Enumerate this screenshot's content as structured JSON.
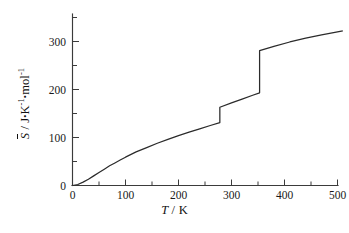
{
  "figure": {
    "background_color": "#ffffff",
    "line_color": "#2b2b2b",
    "axis_color": "#3b3b3b"
  },
  "axes": {
    "x": {
      "label_variable": "T",
      "label_separator": " / ",
      "label_unit": "K",
      "label_full": "T / K",
      "ticks": [
        "0",
        "100",
        "200",
        "300",
        "400",
        "500"
      ],
      "tick_values": [
        0,
        100,
        200,
        300,
        400,
        500
      ],
      "minor_ticks_per_interval": 1,
      "range": [
        0,
        510
      ]
    },
    "y": {
      "label_variable": "S",
      "label_overbar": true,
      "label_separator": " / ",
      "label_unit_1": "J",
      "label_unit_2": "K",
      "label_unit_2_exp": "-1",
      "label_unit_3": "mol",
      "label_unit_3_exp": "-1",
      "label_full": "S̅ / J·K⁻¹·mol⁻¹",
      "ticks": [
        "0",
        "100",
        "200",
        "300"
      ],
      "tick_values": [
        0,
        100,
        200,
        300
      ],
      "minor_ticks_per_interval": 1,
      "range": [
        0,
        355
      ]
    }
  },
  "chart_data": {
    "type": "line",
    "title": "",
    "subtitle": "",
    "xlabel": "T / K",
    "ylabel": "S̅ / J·K⁻¹·mol⁻¹",
    "xlim": [
      0,
      510
    ],
    "ylim": [
      0,
      355
    ],
    "grid": false,
    "legend": null,
    "series": [
      {
        "name": "Molar entropy",
        "color": "#2b2b2b",
        "segments": [
          {
            "phase": "solid",
            "x": [
              0,
              10,
              20,
              30,
              40,
              50,
              60,
              70,
              80,
              90,
              100,
              120,
              140,
              160,
              180,
              200,
              220,
              240,
              260,
              278
            ],
            "y": [
              0,
              2,
              7,
              13,
              20,
              27,
              34,
              41,
              47,
              53,
              59,
              70,
              79,
              88,
              96,
              104,
              111,
              118,
              125,
              131
            ]
          },
          {
            "phase": "liquid",
            "x": [
              278,
              300,
              320,
              340,
              353
            ],
            "y": [
              163,
              172,
              180,
              188,
              193
            ]
          },
          {
            "phase": "gas",
            "x": [
              353,
              380,
              410,
              440,
              470,
              500,
              510
            ],
            "y": [
              281,
              290,
              299,
              307,
              314,
              320,
              322
            ]
          }
        ]
      }
    ],
    "transitions": [
      {
        "name": "fusion",
        "x": 278,
        "y_before": 131,
        "y_after": 163,
        "delta_y": 32
      },
      {
        "name": "vaporization",
        "x": 353,
        "y_before": 193,
        "y_after": 281,
        "delta_y": 88
      }
    ]
  }
}
